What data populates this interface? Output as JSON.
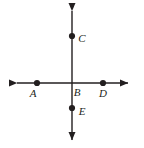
{
  "figure": {
    "type": "geometry-diagram",
    "width": 144,
    "height": 148,
    "background_color": "#ffffff",
    "stroke_color": "#231f20",
    "label_color": "#231f20"
  },
  "lines": [
    {
      "name": "horizontal-line",
      "orientation": "horizontal",
      "x1": 13,
      "y1": 83,
      "x2": 132,
      "y2": 83,
      "arrow_start": true,
      "arrow_end": true
    },
    {
      "name": "vertical-line",
      "orientation": "vertical",
      "x1": 72,
      "y1": 6,
      "x2": 72,
      "y2": 144,
      "arrow_start": true,
      "arrow_end": true
    }
  ],
  "points": [
    {
      "id": "A",
      "label": "A",
      "cx": 37,
      "cy": 83,
      "dot": true,
      "label_x": 33,
      "label_y": 97
    },
    {
      "id": "B",
      "label": "B",
      "cx": 72,
      "cy": 83,
      "dot": false,
      "label_x": 74,
      "label_y": 96
    },
    {
      "id": "C",
      "label": "C",
      "cx": 72,
      "cy": 36,
      "dot": true,
      "label_x": 78,
      "label_y": 42
    },
    {
      "id": "D",
      "label": "D",
      "cx": 103,
      "cy": 83,
      "dot": true,
      "label_x": 99,
      "label_y": 97
    },
    {
      "id": "E",
      "label": "E",
      "cx": 72,
      "cy": 108,
      "dot": true,
      "label_x": 78,
      "label_y": 114
    }
  ]
}
